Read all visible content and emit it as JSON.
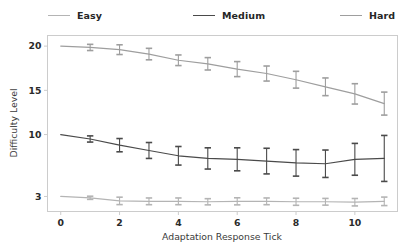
{
  "chart_data": {
    "type": "line",
    "title": "",
    "xlabel": "Adaptation Response Tick",
    "ylabel": "Difficulty Level",
    "x": [
      0,
      1,
      2,
      3,
      4,
      5,
      6,
      7,
      8,
      9,
      10,
      11
    ],
    "xlim": [
      -0.45,
      11.45
    ],
    "ylim": [
      1.3,
      21.2
    ],
    "xticks": [
      0,
      2,
      4,
      6,
      8,
      10
    ],
    "xticklabels": [
      "0",
      "2",
      "4",
      "6",
      "8",
      "10"
    ],
    "yticks": [
      20,
      15,
      10,
      3
    ],
    "yticklabels": [
      "20",
      "15",
      "10",
      "3"
    ],
    "grid": false,
    "legend_position": "top",
    "series": [
      {
        "name": "Easy",
        "color": "#b4b4b4",
        "values": [
          3.0,
          2.85,
          2.5,
          2.45,
          2.45,
          2.4,
          2.45,
          2.45,
          2.4,
          2.4,
          2.35,
          2.45
        ],
        "errors": [
          0.0,
          0.18,
          0.42,
          0.38,
          0.38,
          0.35,
          0.4,
          0.38,
          0.4,
          0.38,
          0.42,
          0.48
        ]
      },
      {
        "name": "Medium",
        "color": "#4a4a4a",
        "values": [
          10.0,
          9.5,
          8.8,
          8.2,
          7.6,
          7.3,
          7.2,
          7.0,
          6.8,
          6.7,
          7.2,
          7.3
        ],
        "errors": [
          0.0,
          0.35,
          0.75,
          0.9,
          1.05,
          1.2,
          1.3,
          1.45,
          1.5,
          1.55,
          1.8,
          2.6
        ]
      },
      {
        "name": "Hard",
        "color": "#9e9e9e",
        "values": [
          20.0,
          19.85,
          19.6,
          19.1,
          18.4,
          18.0,
          17.4,
          16.9,
          16.2,
          15.4,
          14.6,
          13.5
        ],
        "errors": [
          0.0,
          0.35,
          0.55,
          0.65,
          0.6,
          0.7,
          0.85,
          0.85,
          0.95,
          1.0,
          1.15,
          1.3
        ]
      }
    ]
  },
  "legend": {
    "entries": [
      {
        "label": "Easy"
      },
      {
        "label": "Medium"
      },
      {
        "label": "Hard"
      }
    ]
  }
}
